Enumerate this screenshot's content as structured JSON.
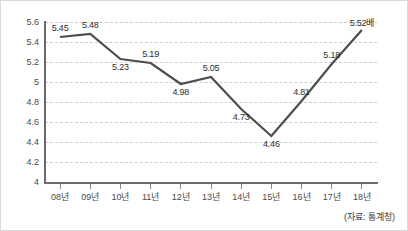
{
  "chart_data": {
    "type": "line",
    "title": "",
    "subtitle": "",
    "xlabel": "",
    "ylabel": "",
    "categories": [
      "08년",
      "09년",
      "10년",
      "11년",
      "12년",
      "13년",
      "14년",
      "15년",
      "16년",
      "17년",
      "18년"
    ],
    "values": [
      5.45,
      5.48,
      5.23,
      5.19,
      4.98,
      5.05,
      4.73,
      4.46,
      4.81,
      5.18,
      5.52
    ],
    "point_labels": [
      "5.45",
      "5.48",
      "5.23",
      "5.19",
      "4.98",
      "5.05",
      "4.73",
      "4.46",
      "4.81",
      "5.18",
      "5.52배"
    ],
    "label_positions": [
      "above",
      "above",
      "below",
      "above",
      "below",
      "above",
      "below",
      "below",
      "above",
      "above",
      "above"
    ],
    "ylim": [
      4,
      5.6
    ],
    "yticks": [
      5.6,
      5.4,
      5.2,
      5,
      4.8,
      4.6,
      4.4,
      4.2,
      4
    ],
    "ytick_labels": [
      "5.6",
      "5.4",
      "5.2",
      "5",
      "4.8",
      "4.6",
      "4.4",
      "4.2",
      "4"
    ],
    "grid": true,
    "grid_style": "dashed-horizontal",
    "legend": "none",
    "line_color": "#4d4d4d",
    "grid_color": "#cfcfcf",
    "axis_color": "#6b6b6b",
    "background": "#ffffff",
    "unit_suffix": "배"
  },
  "annotations": {
    "source": "(자료: 통계청)"
  }
}
